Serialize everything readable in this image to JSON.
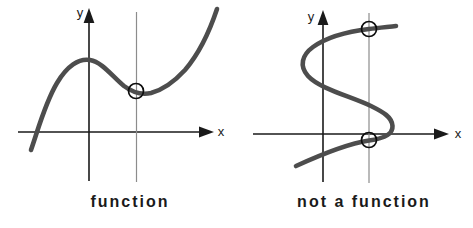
{
  "colors": {
    "background": "#ffffff",
    "curve": "#4d4d4d",
    "axis": "#1a1a1a",
    "vertical_test_line": "#8c8c8c",
    "intersection_circle": "#0d0d0d",
    "caption_text": "#1a1a1a"
  },
  "panels": [
    {
      "caption": "function",
      "x_axis_label": "x",
      "y_axis_label": "y",
      "geometry": {
        "y_axis_line": {
          "x1": 89,
          "y1": 21,
          "x2": 89,
          "y2": 181
        },
        "y_arrow_points": "89,8 83.6,23 94.4,23",
        "x_axis_line": {
          "x1": 18,
          "y1": 132,
          "x2": 201,
          "y2": 132
        },
        "x_arrow_points": "214,132 199,126.6 199,137.4",
        "test_line": {
          "x1": 136.5,
          "y1": 12,
          "x2": 136.5,
          "y2": 182
        },
        "curve_path": "M 31 150 C 38 130 45 103 57 83 C 67 66 79 58 90 60 C 102 62 112 76 124 86 C 132 92 142 95 151 93 C 162 90 174 82 185 70 C 197 56 209 33 217 9",
        "circle_1": {
          "cx": 136,
          "cy": 91,
          "r": 7.5
        },
        "x_label_pos": {
          "x": 221,
          "y": 136
        },
        "y_label_pos": {
          "x": 80,
          "y": 17
        }
      }
    },
    {
      "caption": "not a function",
      "x_axis_label": "x",
      "y_axis_label": "y",
      "geometry": {
        "y_axis_line": {
          "x1": 323,
          "y1": 23,
          "x2": 323,
          "y2": 182
        },
        "y_arrow_points": "323,10 317.6,25 328.4,25",
        "x_axis_line": {
          "x1": 253,
          "y1": 134,
          "x2": 436,
          "y2": 134
        },
        "x_arrow_points": "449,134 434,128.6 434,139.4",
        "test_line": {
          "x1": 369,
          "y1": 13,
          "x2": 369,
          "y2": 183
        },
        "curve_path": "M 396 26 C 387 27 377 28 369 29 C 348 31.5 327 37 313 47 C 302 55 299 66 308 76 C 320 89 350 96 371 106 C 383 112 392 117 392.5 126 C 393 135 381 139 369 140.5 C 349 143.5 320 155 296 166",
        "circle_1": {
          "cx": 369,
          "cy": 29,
          "r": 7.5
        },
        "circle_2": {
          "cx": 369,
          "cy": 140,
          "r": 7.5
        },
        "x_label_pos": {
          "x": 458,
          "y": 138
        },
        "y_label_pos": {
          "x": 311,
          "y": 21
        }
      }
    }
  ]
}
